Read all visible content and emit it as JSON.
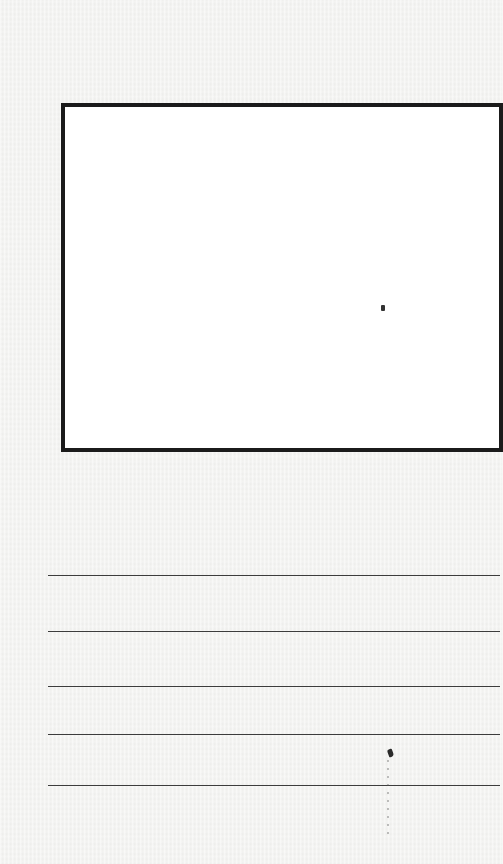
{
  "page": {
    "background_color": "#f3f3f1",
    "type": "blank worksheet"
  },
  "drawing_box": {
    "label": "",
    "border_color": "#1b1b1b",
    "fill_color": "#ffffff"
  },
  "writing_lines": {
    "count": 5,
    "line_color": "#3c3c3c",
    "items": [
      {
        "text": ""
      },
      {
        "text": ""
      },
      {
        "text": ""
      },
      {
        "text": ""
      },
      {
        "text": ""
      }
    ]
  }
}
